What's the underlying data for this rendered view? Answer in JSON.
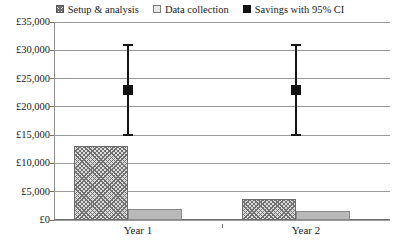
{
  "legend": {
    "position": "top-center",
    "items": [
      {
        "label": "Setup & analysis",
        "marker": "hatched-square-icon",
        "swatch_class": "sw-hatch"
      },
      {
        "label": "Data collection",
        "marker": "light-square-icon",
        "swatch_class": "sw-gray"
      },
      {
        "label": "Savings with 95% CI",
        "marker": "filled-square-icon",
        "swatch_class": "sw-solid"
      }
    ]
  },
  "axes": {
    "y_tick_labels": [
      "£35,000",
      "£30,000",
      "£25,000",
      "£20,000",
      "£15,000",
      "£10,000",
      "£5,000",
      "£0"
    ],
    "y_tick_values": [
      35000,
      30000,
      25000,
      20000,
      15000,
      10000,
      5000,
      0
    ],
    "x_tick_labels": [
      "Year 1",
      "Year 2"
    ]
  },
  "colors": {
    "hatch_fill": "#dcdcdc",
    "hatch_line": "#707070",
    "gray_bar": "#b9b9b9",
    "marker": "#111111",
    "gridline": "#9a9a9a",
    "text": "#1a1a1a"
  },
  "chart_data": {
    "type": "bar",
    "title": "",
    "subtitle": "",
    "xlabel": "",
    "ylabel": "",
    "ylim": [
      0,
      35000
    ],
    "ytick_step": 5000,
    "grid": true,
    "legend_position": "top-center",
    "currency": "GBP",
    "categories": [
      "Year 1",
      "Year 2"
    ],
    "series": [
      {
        "name": "Setup & analysis",
        "type": "bar",
        "values": [
          13000,
          3800
        ]
      },
      {
        "name": "Data collection",
        "type": "bar",
        "values": [
          2000,
          1600
        ]
      },
      {
        "name": "Savings with 95% CI",
        "type": "point-with-error",
        "values": [
          23000,
          23000
        ],
        "ci_lower": [
          15000,
          15000
        ],
        "ci_upper": [
          31000,
          31000
        ]
      }
    ]
  }
}
